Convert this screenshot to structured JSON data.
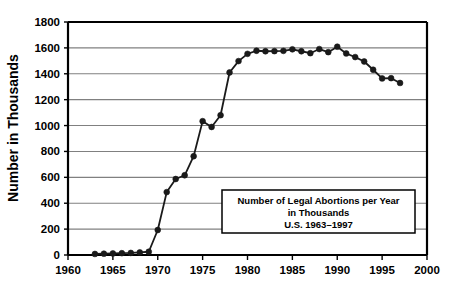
{
  "chart_data": {
    "type": "line",
    "title": "",
    "xlabel": "",
    "ylabel": "Number in Thousands",
    "xlim": [
      1960,
      2000
    ],
    "ylim": [
      0,
      1800
    ],
    "ytick_step": 200,
    "xtick_step": 5,
    "grid": true,
    "grid_axis": "y",
    "legend_position": "inside-lower-right",
    "marker": "filled-circle",
    "line_color": "#1a1a1a",
    "marker_color": "#1a1a1a",
    "grid_color": "#808080",
    "axis_color": "#000000",
    "background_color": "#ffffff",
    "xticks": [
      1960,
      1965,
      1970,
      1975,
      1980,
      1985,
      1990,
      1995,
      2000
    ],
    "xtick_labels": [
      "1960",
      "1965",
      "1970",
      "1975",
      "1980",
      "1985",
      "1990",
      "1995",
      "2000"
    ],
    "yticks": [
      0,
      200,
      400,
      600,
      800,
      1000,
      1200,
      1400,
      1600,
      1800
    ],
    "ytick_labels": [
      "0",
      "200",
      "400",
      "600",
      "800",
      "1000",
      "1200",
      "1400",
      "1600",
      "1800"
    ],
    "series": [
      {
        "name": "Legal abortions per year (thousands), U.S.",
        "x": [
          1963,
          1964,
          1965,
          1966,
          1967,
          1968,
          1969,
          1970,
          1971,
          1972,
          1973,
          1974,
          1975,
          1976,
          1977,
          1978,
          1979,
          1980,
          1981,
          1982,
          1983,
          1984,
          1985,
          1986,
          1987,
          1988,
          1989,
          1990,
          1991,
          1992,
          1993,
          1994,
          1995,
          1996,
          1997
        ],
        "values": [
          8,
          10,
          12,
          14,
          16,
          20,
          25,
          193,
          486,
          587,
          616,
          763,
          1034,
          989,
          1080,
          1410,
          1498,
          1554,
          1578,
          1574,
          1575,
          1577,
          1589,
          1574,
          1559,
          1591,
          1567,
          1609,
          1557,
          1529,
          1495,
          1431,
          1364,
          1366,
          1329
        ]
      }
    ]
  },
  "legend_box": {
    "lines": [
      "Number of Legal Abortions per Year",
      "in Thousands",
      "U.S. 1963–1997"
    ],
    "border_color": "#000000",
    "fill_color": "#ffffff"
  }
}
